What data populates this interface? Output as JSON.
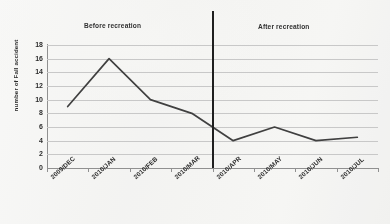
{
  "chart_data": {
    "type": "line",
    "title": "",
    "subtitle": "",
    "xlabel": "",
    "ylabel": "number of Fall accident",
    "categories": [
      "2009/DEC",
      "2010/JAN",
      "2010/FEB",
      "2010/MAR",
      "2010/APR",
      "2010/MAY",
      "2010/JUN",
      "2010/JUL"
    ],
    "values": [
      9,
      16,
      10,
      8,
      4,
      6,
      4,
      4.5
    ],
    "series": [
      {
        "name": "number of Fall accident",
        "values": [
          9,
          16,
          10,
          8,
          4,
          6,
          4,
          4.5
        ]
      }
    ],
    "ylim": [
      0,
      18
    ],
    "ytick_values": [
      18,
      16,
      14,
      12,
      10,
      8,
      6,
      4,
      2,
      0
    ],
    "ytick_labels": [
      "18",
      "16",
      "14",
      "12",
      "10",
      "8",
      "6",
      "4",
      "2",
      "0"
    ],
    "ytick_step": 2,
    "grid": true,
    "grid_axis": "y",
    "legend": false,
    "legend_position": "none",
    "line_color": "#3a3a3a",
    "gridline_color": "#c9c9c9",
    "background_color": "#fbfbfa",
    "annotations": [
      {
        "name": "before-recreation-label",
        "text": "Before recreation",
        "position": "top-left"
      },
      {
        "name": "after-recreation-label",
        "text": "After recreation",
        "position": "top-right"
      },
      {
        "name": "intervention-divider",
        "type": "vertical-line",
        "at_category": "2010/APR",
        "color": "#171717",
        "value_at_crossing": 6
      }
    ]
  }
}
